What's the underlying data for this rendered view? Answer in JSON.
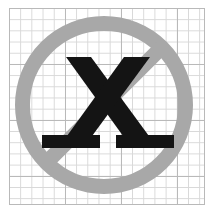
{
  "canvas": {
    "width": 212,
    "height": 216,
    "background_color": "#FFFFFF"
  },
  "grid": {
    "name": "graph-paper-grid",
    "left": 9,
    "top": 8,
    "width": 196,
    "height": 197,
    "minor_cell_px": 11.2,
    "major_cell_px": 56,
    "minor_line_color": "#D8D8D8",
    "major_line_color": "#B9B9B9",
    "paper_color": "#FFFFFF"
  },
  "prohibition_sign": {
    "name": "no-symbol",
    "label": "prohibition sign",
    "ring_color": "#A8A8A8",
    "slash_color": "#A8A8A8",
    "center_x": 104,
    "center_y": 105,
    "outer_radius": 89,
    "stroke_width": 15,
    "slash_angle_deg": -45,
    "slash_direction": "upper-right-to-lower-left"
  },
  "letter_mark": {
    "name": "letter-x-glyph",
    "character": "X",
    "color": "#141414",
    "style": "bold-serif",
    "has_bottom_serifs": true,
    "has_top_serifs": false,
    "left": 59,
    "top": 55,
    "width": 98,
    "height": 92
  }
}
